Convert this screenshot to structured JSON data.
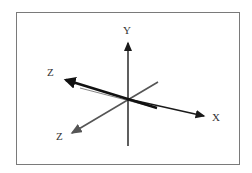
{
  "diagram": {
    "type": "3d-coordinate-axes",
    "origin": [
      128,
      99
    ],
    "axes": [
      {
        "id": "y",
        "label": "Y",
        "color": "#1a1a1a",
        "tip": [
          128,
          40
        ],
        "tail": [
          128,
          146
        ],
        "label_pos": [
          127,
          33
        ]
      },
      {
        "id": "x",
        "label": "X",
        "color": "#1a1a1a",
        "tip": [
          207,
          117
        ],
        "tail": [
          128,
          99
        ],
        "label_pos": [
          216,
          121
        ]
      },
      {
        "id": "z-back",
        "label": "Z",
        "color": "#111111",
        "tip": [
          62,
          79
        ],
        "tail": [
          157,
          108
        ],
        "label_pos": [
          51,
          76
        ]
      },
      {
        "id": "z-front",
        "label": "Z",
        "color": "#555555",
        "tip": [
          70,
          134
        ],
        "tail": [
          158,
          82
        ],
        "label_pos": [
          57,
          140
        ]
      }
    ],
    "frame_color": "#7a7a7a"
  }
}
